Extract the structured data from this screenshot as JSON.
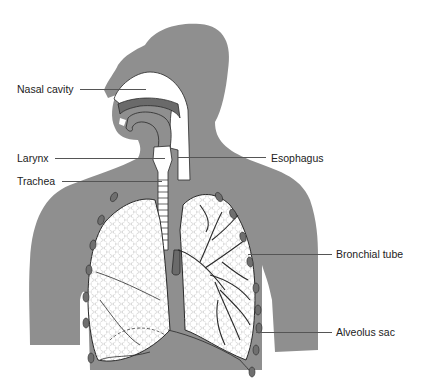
{
  "diagram": {
    "colors": {
      "body": "#8f8f8f",
      "organ_fill": "#ffffff",
      "outline": "#2a2a2a",
      "rib": "#6f6f6f",
      "text": "#222222"
    },
    "labels": [
      {
        "id": "nasal-cavity",
        "text": "Nasal cavity",
        "side": "left"
      },
      {
        "id": "larynx",
        "text": "Larynx",
        "side": "left"
      },
      {
        "id": "trachea",
        "text": "Trachea",
        "side": "left"
      },
      {
        "id": "esophagus",
        "text": "Esophagus",
        "side": "right"
      },
      {
        "id": "bronchial-tube",
        "text": "Bronchial tube",
        "side": "right"
      },
      {
        "id": "alveolus-sac",
        "text": "Alveolus sac",
        "side": "right"
      }
    ]
  }
}
